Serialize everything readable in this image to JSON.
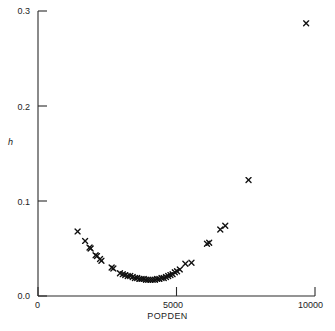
{
  "chart_data": {
    "type": "scatter",
    "title": "",
    "xlabel": "POPDEN",
    "ylabel": "h",
    "xlim": [
      0,
      10000
    ],
    "ylim": [
      0.0,
      0.3
    ],
    "grid": false,
    "legend": null,
    "marker": "x",
    "marker_color": "#111111",
    "xticks": [
      0,
      5000,
      10000
    ],
    "xtick_labels": [
      "0",
      "5000",
      "10000"
    ],
    "yticks": [
      0.0,
      0.1,
      0.2,
      0.3
    ],
    "ytick_labels": [
      "0.0",
      "0.1",
      "0.2",
      "0.3"
    ],
    "series": [
      {
        "name": "leverage",
        "points": [
          [
            1430,
            0.068
          ],
          [
            1700,
            0.058
          ],
          [
            1860,
            0.051
          ],
          [
            1900,
            0.05
          ],
          [
            2080,
            0.043
          ],
          [
            2130,
            0.042
          ],
          [
            2240,
            0.039
          ],
          [
            2290,
            0.037
          ],
          [
            2660,
            0.03
          ],
          [
            2720,
            0.029
          ],
          [
            2960,
            0.024
          ],
          [
            3060,
            0.023
          ],
          [
            3150,
            0.022
          ],
          [
            3240,
            0.021
          ],
          [
            3330,
            0.021
          ],
          [
            3420,
            0.02
          ],
          [
            3500,
            0.019
          ],
          [
            3580,
            0.019
          ],
          [
            3660,
            0.018
          ],
          [
            3740,
            0.018
          ],
          [
            3820,
            0.018
          ],
          [
            3900,
            0.017
          ],
          [
            3980,
            0.017
          ],
          [
            4060,
            0.017
          ],
          [
            4140,
            0.017
          ],
          [
            4220,
            0.017
          ],
          [
            4300,
            0.018
          ],
          [
            4380,
            0.018
          ],
          [
            4460,
            0.019
          ],
          [
            4540,
            0.019
          ],
          [
            4620,
            0.02
          ],
          [
            4700,
            0.021
          ],
          [
            4780,
            0.022
          ],
          [
            4860,
            0.023
          ],
          [
            4940,
            0.025
          ],
          [
            5020,
            0.026
          ],
          [
            5120,
            0.028
          ],
          [
            5320,
            0.034
          ],
          [
            5540,
            0.035
          ],
          [
            6100,
            0.055
          ],
          [
            6180,
            0.056
          ],
          [
            6580,
            0.07
          ],
          [
            6760,
            0.074
          ],
          [
            7600,
            0.122
          ],
          [
            9680,
            0.287
          ]
        ]
      }
    ]
  },
  "axes": {
    "y_title": "h",
    "x_title": "POPDEN",
    "y_labels": [
      "0.3",
      "0.2",
      "0.1",
      "0.0"
    ],
    "x_labels": [
      "0",
      "5000",
      "10000"
    ]
  }
}
